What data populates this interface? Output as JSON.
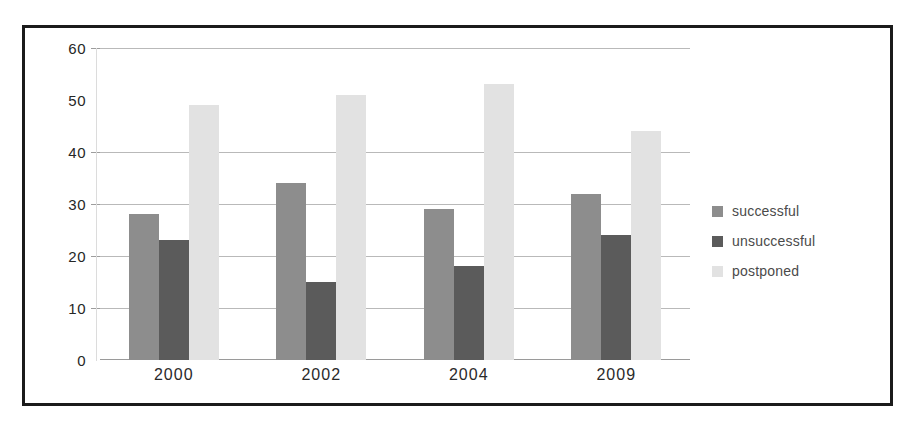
{
  "chart_data": {
    "type": "bar",
    "title": "",
    "subtitle": "",
    "xlabel": "",
    "ylabel": "",
    "categories": [
      "2000",
      "2002",
      "2004",
      "2009"
    ],
    "series": [
      {
        "name": "successful",
        "values": [
          28,
          34,
          29,
          32
        ],
        "color": "#8d8d8d"
      },
      {
        "name": "unsuccessful",
        "values": [
          23,
          15,
          18,
          24
        ],
        "color": "#5b5b5b"
      },
      {
        "name": "postponed",
        "values": [
          49,
          51,
          53,
          44
        ],
        "color": "#e2e2e2"
      }
    ],
    "ylim": [
      0,
      60
    ],
    "yticks": [
      0,
      10,
      20,
      30,
      40,
      50,
      60
    ],
    "ytick_labels": [
      "0",
      "10",
      "20",
      "30",
      "40",
      "50",
      "60"
    ],
    "grid": true,
    "legend_position": "right"
  },
  "legend": {
    "items": [
      {
        "label": "successful"
      },
      {
        "label": "unsuccessful"
      },
      {
        "label": "postponed"
      }
    ]
  },
  "axis": {
    "y_labels": [
      "60",
      "50",
      "40",
      "30",
      "20",
      "10",
      "0"
    ],
    "x_labels": [
      "2000",
      "2002",
      "2004",
      "2009"
    ]
  },
  "colors": {
    "successful": "#8d8d8d",
    "unsuccessful": "#5b5b5b",
    "postponed": "#e2e2e2",
    "gridline": "#b9b9b9",
    "frame": "#1b1b1b",
    "background": "#ffffff"
  }
}
